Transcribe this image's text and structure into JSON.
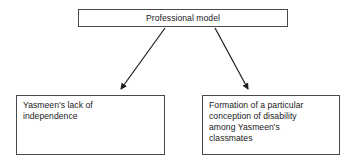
{
  "diagram": {
    "type": "flowchart",
    "title": "",
    "background_color": "#ffffff",
    "box_border_color": "#4a4a4a",
    "text_color": "#1a1a1a",
    "connector_color": "#222222",
    "nodes": [
      {
        "id": "root",
        "label": "Professional model",
        "role": "root-cause"
      },
      {
        "id": "left",
        "label": "Yasmeen's lack of\nindependence",
        "role": "outcome"
      },
      {
        "id": "right",
        "label": "Formation of a particular\nconception of disability\namong Yasmeen's\nclassmates",
        "role": "outcome"
      }
    ],
    "connectors": [
      {
        "id": "root-to-left",
        "from": "root",
        "to": "left",
        "style": "solid-arrow",
        "direction": "down-left"
      },
      {
        "id": "root-to-right",
        "from": "root",
        "to": "right",
        "style": "solid-arrow",
        "direction": "down-right"
      }
    ]
  }
}
